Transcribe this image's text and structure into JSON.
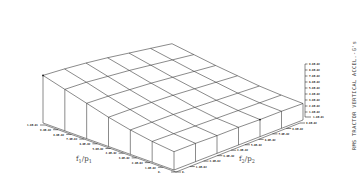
{
  "chart_data": {
    "type": "surface-3d-wireframe",
    "title": "",
    "zlabel": "RMS TRACTOR VERTICAL ACCEL.-G's",
    "xlabel": "f1/p1",
    "ylabel": "f2/p2",
    "x_axis": {
      "name": "f1/p1",
      "ticks": [
        "0.",
        "1.0E-02",
        "2.0E-02",
        "3.0E-02",
        "4.0E-02",
        "5.0E-02",
        "6.0E-02",
        "7.0E-02",
        "8.0E-02",
        "9.0E-02",
        "1.0E-01"
      ]
    },
    "y_axis": {
      "name": "f2/p2",
      "ticks": [
        "0.",
        "1.0E-02",
        "2.0E-02",
        "3.0E-02",
        "4.0E-02",
        "5.0E-02",
        "6.0E-02",
        "7.0E-02",
        "8.0E-02",
        "9.0E-02"
      ]
    },
    "z_axis": {
      "name": "RMS TRACTOR VERTICAL ACCEL.-G's",
      "ticks": [
        "1.0E-02",
        "2.0E-02",
        "3.0E-02",
        "4.0E-02",
        "5.0E-02",
        "6.0E-02",
        "7.0E-02",
        "8.0E-02",
        "9.0E-02"
      ],
      "base_label": "1.0E-01"
    },
    "grid_size": [
      7,
      7
    ],
    "z_values_approx": [
      [
        0.09,
        0.087,
        0.083,
        0.078,
        0.072,
        0.066,
        0.06
      ],
      [
        0.08,
        0.078,
        0.074,
        0.07,
        0.065,
        0.06,
        0.055
      ],
      [
        0.07,
        0.068,
        0.065,
        0.062,
        0.058,
        0.054,
        0.05
      ],
      [
        0.06,
        0.059,
        0.057,
        0.055,
        0.052,
        0.049,
        0.046
      ],
      [
        0.052,
        0.051,
        0.05,
        0.048,
        0.046,
        0.044,
        0.042
      ],
      [
        0.046,
        0.045,
        0.044,
        0.043,
        0.042,
        0.041,
        0.04
      ],
      [
        0.042,
        0.042,
        0.041,
        0.041,
        0.04,
        0.04,
        0.039
      ]
    ],
    "grid": false,
    "legend": null
  },
  "labels": {
    "x_axis_title": "f",
    "x_axis_sub1": "1",
    "x_axis_mid": "/p",
    "x_axis_sub2": "1",
    "y_axis_title": "f",
    "y_axis_sub1": "2",
    "y_axis_mid": "/p",
    "y_axis_sub2": "2",
    "z_title": "RMS TRACTOR VERTICAL ACCEL.-G's"
  }
}
